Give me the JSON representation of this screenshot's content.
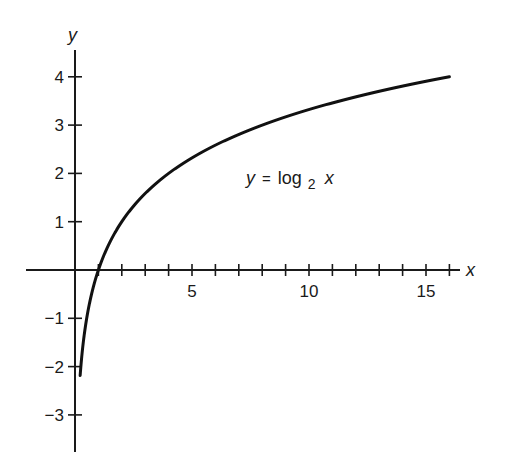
{
  "chart_data": {
    "type": "line",
    "title": "",
    "xlabel": "x",
    "ylabel": "y",
    "annotation": "y = log₂ x",
    "annotation_parts": {
      "lhs": "y",
      "eq": "=",
      "fn": "log",
      "sub": "2",
      "arg": "x"
    },
    "xlim": [
      -2,
      17
    ],
    "ylim": [
      -3.8,
      4.6
    ],
    "x_ticks": [
      1,
      2,
      3,
      4,
      5,
      6,
      7,
      8,
      9,
      10,
      11,
      12,
      13,
      14,
      15,
      16
    ],
    "x_tick_labels": [
      {
        "value": 5,
        "label": "5"
      },
      {
        "value": 10,
        "label": "10"
      },
      {
        "value": 15,
        "label": "15"
      }
    ],
    "y_ticks": [
      {
        "value": 4,
        "label": "4"
      },
      {
        "value": 3,
        "label": "3"
      },
      {
        "value": 2,
        "label": "2"
      },
      {
        "value": 1,
        "label": "1"
      },
      {
        "value": -1,
        "label": "-1"
      },
      {
        "value": -2,
        "label": "-2"
      },
      {
        "value": -3,
        "label": "-3"
      }
    ],
    "grid": false,
    "legend": null,
    "series": [
      {
        "name": "y = log2 x",
        "function": "log2",
        "x": [
          0.22,
          0.25,
          0.5,
          1,
          2,
          3,
          4,
          5,
          6,
          7,
          8,
          9,
          10,
          11,
          12,
          13,
          14,
          15,
          16
        ],
        "values": [
          -2.18,
          -2,
          -1,
          0,
          1,
          1.58,
          2,
          2.32,
          2.58,
          2.81,
          3,
          3.17,
          3.32,
          3.46,
          3.58,
          3.7,
          3.81,
          3.91,
          4
        ]
      }
    ]
  },
  "colors": {
    "ink": "#1a1a1a",
    "background": "#ffffff"
  }
}
